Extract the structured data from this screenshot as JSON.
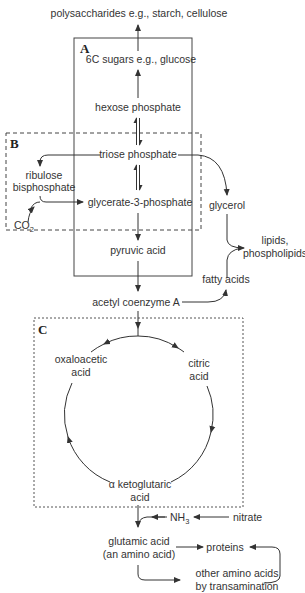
{
  "diagram": {
    "type": "metabolic-pathway",
    "colors": {
      "line": "#333333",
      "text": "#333333",
      "background": "#ffffff"
    },
    "regions": {
      "A": {
        "label": "A",
        "style": "solid"
      },
      "B": {
        "label": "B",
        "style": "dashed"
      },
      "C": {
        "label": "C",
        "style": "dotted"
      }
    },
    "nodes": {
      "polysaccharides": "polysaccharides e.g., starch, cellulose",
      "sugars6c": "6C sugars e.g., glucose",
      "hexose_phosphate": "hexose phosphate",
      "triose_phosphate": "triose phosphate",
      "ribulose_1": "ribulose",
      "ribulose_2": "bisphosphate",
      "co2_main": "CO",
      "co2_sub": "2",
      "glycerate": "glycerate-3-phosphate",
      "glycerol": "glycerol",
      "pyruvic_acid": "pyruvic acid",
      "lipids_1": "lipids,",
      "lipids_2": "phospholipids",
      "fatty_acids": "fatty acids",
      "acetyl_coa": "acetyl coenzyme A",
      "oxaloacetic_1": "oxaloacetic",
      "oxaloacetic_2": "acid",
      "citric_1": "citric",
      "citric_2": "acid",
      "ketoglutaric_1": "α ketoglutaric",
      "ketoglutaric_2": "acid",
      "nh3_main": "NH",
      "nh3_sub": "3",
      "nitrate": "nitrate",
      "glutamic_1": "glutamic acid",
      "glutamic_2": "(an amino acid)",
      "proteins": "proteins",
      "other_amino_1": "other amino acids",
      "other_amino_2": "by transamination"
    },
    "edges": [
      [
        "6C sugars e.g., glucose",
        "polysaccharides e.g., starch, cellulose"
      ],
      [
        "hexose phosphate",
        "6C sugars e.g., glucose"
      ],
      [
        "triose phosphate",
        "hexose phosphate",
        "reversible"
      ],
      [
        "glycerate-3-phosphate",
        "triose phosphate",
        "reversible"
      ],
      [
        "triose phosphate",
        "ribulose bisphosphate"
      ],
      [
        "ribulose bisphosphate + CO2",
        "glycerate-3-phosphate"
      ],
      [
        "triose phosphate",
        "glycerol"
      ],
      [
        "glycerol",
        "lipids, phospholipids"
      ],
      [
        "fatty acids",
        "lipids, phospholipids"
      ],
      [
        "acetyl coenzyme A",
        "fatty acids"
      ],
      [
        "glycerate-3-phosphate",
        "pyruvic acid"
      ],
      [
        "pyruvic acid",
        "acetyl coenzyme A"
      ],
      [
        "acetyl coenzyme A",
        "Krebs cycle"
      ],
      [
        "oxaloacetic acid",
        "citric acid",
        "cycle"
      ],
      [
        "citric acid",
        "α ketoglutaric acid",
        "cycle"
      ],
      [
        "α ketoglutaric acid",
        "oxaloacetic acid",
        "cycle"
      ],
      [
        "nitrate",
        "NH3"
      ],
      [
        "α ketoglutaric acid + NH3",
        "glutamic acid"
      ],
      [
        "glutamic acid",
        "proteins"
      ],
      [
        "glutamic acid",
        "other amino acids by transamination"
      ],
      [
        "other amino acids by transamination",
        "proteins"
      ]
    ]
  }
}
